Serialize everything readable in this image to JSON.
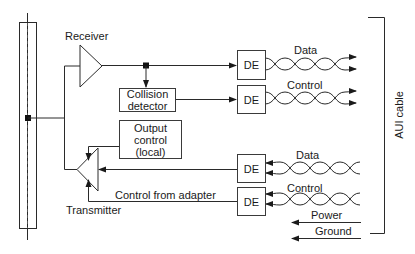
{
  "diagram": {
    "labels": {
      "receiver": "Receiver",
      "transmitter": "Transmitter",
      "collision_detector": "Collision detector",
      "collision_line1": "Collision",
      "collision_line2": "detector",
      "output_control_line1": "Output",
      "output_control_line2": "control",
      "output_control_line3": "(local)",
      "control_from_adapter": "Control from adapter",
      "aui_cable": "AUI cable",
      "power": "Power",
      "ground": "Ground"
    },
    "de_blocks": [
      {
        "label": "DE",
        "signal": "Data",
        "direction": "out"
      },
      {
        "label": "DE",
        "signal": "Control",
        "direction": "out"
      },
      {
        "label": "DE",
        "signal": "Data",
        "direction": "in"
      },
      {
        "label": "DE",
        "signal": "Control",
        "direction": "in"
      }
    ],
    "colors": {
      "line": "#2a2a2a",
      "background": "#ffffff"
    }
  }
}
